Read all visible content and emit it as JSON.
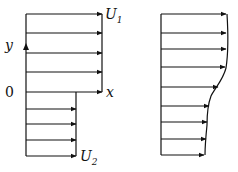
{
  "left_diagram": {
    "title": "Initial velocity profile (discontinuous shear layer)",
    "labels": {
      "upper_velocity": "U",
      "upper_velocity_sub": "1",
      "lower_velocity": "U",
      "lower_velocity_sub": "2",
      "y_axis": "y",
      "x_axis": "x",
      "origin": "0"
    },
    "upper_arrows_y": [
      14,
      33,
      53,
      72,
      92
    ],
    "upper_arrow_tip_x": 102,
    "lower_arrows_y": [
      109,
      124,
      140,
      156
    ],
    "lower_arrow_tip_x": 76,
    "base_x": 26
  },
  "right_diagram": {
    "title": "Smoothed velocity profile",
    "base_x": 161,
    "arrows": [
      {
        "y": 14,
        "tip": 226
      },
      {
        "y": 33,
        "tip": 226
      },
      {
        "y": 49,
        "tip": 226
      },
      {
        "y": 67,
        "tip": 225
      },
      {
        "y": 87,
        "tip": 218
      },
      {
        "y": 106,
        "tip": 209
      },
      {
        "y": 122,
        "tip": 207
      },
      {
        "y": 139,
        "tip": 206
      },
      {
        "y": 155,
        "tip": 204
      }
    ]
  },
  "colors": {
    "stroke": "#111111",
    "background": "#ffffff"
  }
}
